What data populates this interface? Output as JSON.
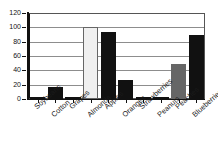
{
  "chart_data": {
    "type": "bar",
    "title": "",
    "xlabel": "",
    "ylabel": "",
    "ylim": [
      0,
      120
    ],
    "yticks": [
      0,
      20,
      40,
      60,
      80,
      100,
      120
    ],
    "grid": true,
    "legend": null,
    "categories": [
      "Soybeans",
      "Cotton",
      "Grapes",
      "Almonds",
      "Apples",
      "Oranges",
      "Strawberries",
      "Peanuts",
      "Peaches",
      "Blueberries"
    ],
    "values": [
      2,
      17,
      2,
      100,
      94,
      26,
      2,
      2,
      49,
      89
    ],
    "bar_colors": [
      "#111111",
      "#111111",
      "#111111",
      "#f0f0f0",
      "#111111",
      "#111111",
      "#111111",
      "#111111",
      "#666666",
      "#111111"
    ],
    "axis_color": "#111111",
    "grid_color": "#8d8d8d"
  },
  "labels": {
    "y": [
      "120",
      "100",
      "80",
      "60",
      "40",
      "20",
      "0"
    ],
    "title_remnant": "."
  }
}
